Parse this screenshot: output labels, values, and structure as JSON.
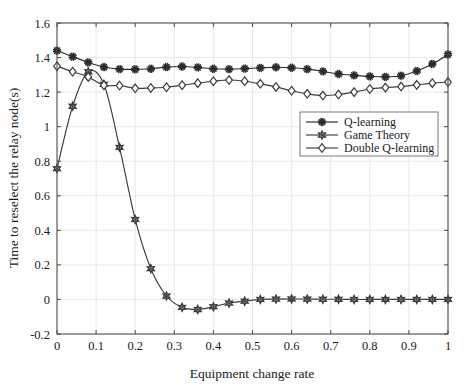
{
  "chart_data": {
    "type": "line",
    "title": "",
    "xlabel": "Equipment change rate",
    "ylabel": "Time to reselect the relay node(s)",
    "xlim": [
      0,
      1
    ],
    "ylim": [
      -0.2,
      1.6
    ],
    "xticks": [
      0,
      0.1,
      0.2,
      0.3,
      0.4,
      0.5,
      0.6,
      0.7,
      0.8,
      0.9,
      1
    ],
    "xtick_labels": [
      "0",
      "0.1",
      "0.2",
      "0.3",
      "0.4",
      "0.5",
      "0.6",
      "0.7",
      "0.8",
      "0.9",
      "1"
    ],
    "yticks": [
      -0.2,
      0,
      0.2,
      0.4,
      0.6,
      0.8,
      1,
      1.2,
      1.4,
      1.6
    ],
    "ytick_labels": [
      "-0.2",
      "0",
      "0.2",
      "0.4",
      "0.6",
      "0.8",
      "1",
      "1.2",
      "1.4",
      "1.6"
    ],
    "grid": true,
    "legend_position": "center-right",
    "background_color": "#ffffff",
    "line_color": "#3c3c3c",
    "grid_color": "#e2e2e2",
    "x": [
      0,
      0.04,
      0.08,
      0.12,
      0.16,
      0.2,
      0.24,
      0.28,
      0.32,
      0.36,
      0.4,
      0.44,
      0.48,
      0.52,
      0.56,
      0.6,
      0.64,
      0.68,
      0.72,
      0.76,
      0.8,
      0.84,
      0.88,
      0.92,
      0.96,
      1.0
    ],
    "series": [
      {
        "name": "Q-learning",
        "marker": "asterisk",
        "color": "#2b2b2b",
        "values": [
          1.44,
          1.405,
          1.372,
          1.345,
          1.333,
          1.332,
          1.335,
          1.345,
          1.348,
          1.343,
          1.335,
          1.333,
          1.336,
          1.34,
          1.344,
          1.341,
          1.333,
          1.32,
          1.305,
          1.297,
          1.291,
          1.288,
          1.295,
          1.322,
          1.363,
          1.418
        ]
      },
      {
        "name": "Game Theory",
        "marker": "hexagram",
        "color": "#3c3c3c",
        "values": [
          0.757,
          1.118,
          1.318,
          1.245,
          0.88,
          0.463,
          0.178,
          0.02,
          -0.046,
          -0.058,
          -0.042,
          -0.021,
          -0.01,
          0.0,
          0.002,
          0.003,
          0.002,
          0.001,
          0.001,
          0.0,
          0.0,
          0.0,
          0.0,
          0.0,
          0.0,
          0.0
        ]
      },
      {
        "name": "Double Q-learning",
        "marker": "diamond",
        "color": "#3c3c3c",
        "values": [
          1.35,
          1.318,
          1.288,
          1.24,
          1.238,
          1.222,
          1.224,
          1.228,
          1.24,
          1.252,
          1.263,
          1.27,
          1.263,
          1.248,
          1.23,
          1.208,
          1.19,
          1.18,
          1.186,
          1.2,
          1.218,
          1.226,
          1.232,
          1.242,
          1.252,
          1.258
        ]
      }
    ]
  },
  "legend": {
    "entries": [
      {
        "label": "Q-learning"
      },
      {
        "label": "Game Theory"
      },
      {
        "label": "Double Q-learning"
      }
    ]
  }
}
